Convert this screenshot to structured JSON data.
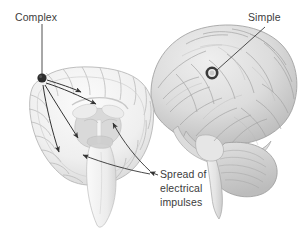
{
  "figure": {
    "name": "brain-seizure-spread-diagram",
    "background_color": "#ffffff",
    "width": 303,
    "height": 231,
    "label_color": "#3c3c3c",
    "line_color": "#333333",
    "brain_fill_light": "#f2f2f2",
    "brain_fill_mid": "#d9d9d9",
    "brain_fill_dark": "#b8b8b8",
    "marker_color": "#2e2e2e"
  },
  "labels": {
    "complex": "Complex",
    "simple": "Simple",
    "spread_line1": "Spread of",
    "spread_line2": "electrical",
    "spread_line3": "impulses"
  },
  "markers": {
    "complex_focus": {
      "x": 42,
      "y": 78,
      "type": "filled-dot"
    },
    "simple_focus": {
      "x": 212,
      "y": 73,
      "type": "ring"
    }
  },
  "views": {
    "coronal_section": "coronal brain cross-section with cortex, ventricles and brainstem",
    "lateral_brain": "lateral whole-brain view with cerebellum and temporal lobe"
  }
}
